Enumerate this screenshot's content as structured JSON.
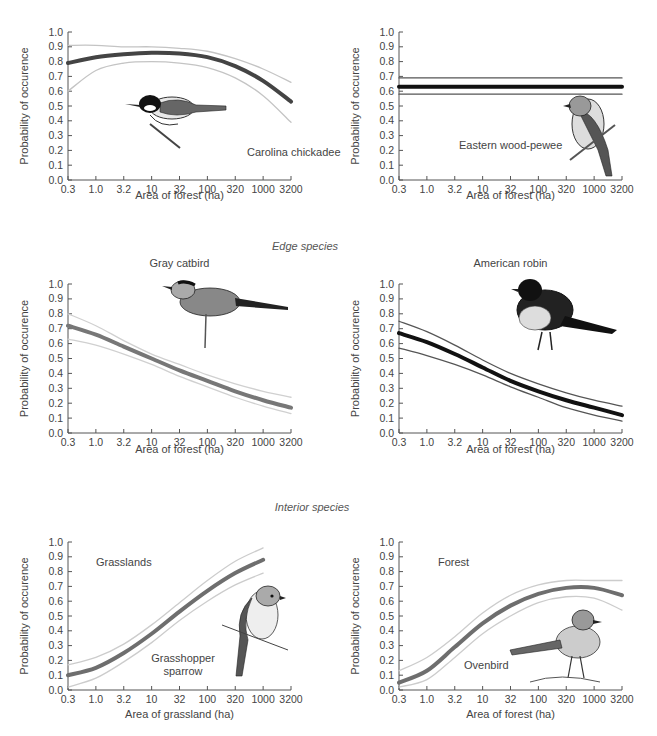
{
  "sections": {
    "edge": "Edge species",
    "interior": "Interior species"
  },
  "chart_data": [
    {
      "type": "line",
      "id": "carolina-chickadee",
      "title": "",
      "annotation": "Carolina chickadee",
      "xlabel": "Area of forest (ha)",
      "ylabel": "Probability of occurence",
      "ylim": [
        0,
        1.0
      ],
      "yticks": [
        "0.0",
        "0.1",
        "0.2",
        "0.3",
        "0.4",
        "0.5",
        "0.6",
        "0.7",
        "0.8",
        "0.9",
        "1.0"
      ],
      "categories": [
        "0.3",
        "1.0",
        "3.2",
        "10",
        "32",
        "100",
        "320",
        "1000",
        "3200"
      ],
      "x_scale": "log",
      "grid": false,
      "series": [
        {
          "name": "upper CI",
          "values": [
            0.91,
            0.91,
            0.9,
            0.9,
            0.89,
            0.87,
            0.82,
            0.75,
            0.66
          ]
        },
        {
          "name": "estimate",
          "values": [
            0.79,
            0.83,
            0.85,
            0.86,
            0.855,
            0.83,
            0.77,
            0.67,
            0.53
          ]
        },
        {
          "name": "lower CI",
          "values": [
            0.6,
            0.74,
            0.79,
            0.8,
            0.79,
            0.76,
            0.69,
            0.57,
            0.39
          ]
        }
      ],
      "colors": {
        "estimate": "#444444",
        "ci": "#c4c4c4"
      }
    },
    {
      "type": "line",
      "id": "eastern-wood-pewee",
      "title": "",
      "annotation": "Eastern wood-pewee",
      "xlabel": "Area of forest (ha)",
      "ylabel": "Probability of occurence",
      "ylim": [
        0,
        1.0
      ],
      "yticks": [
        "0.0",
        "0.1",
        "0.2",
        "0.3",
        "0.4",
        "0.5",
        "0.6",
        "0.7",
        "0.8",
        "0.9",
        "1.0"
      ],
      "categories": [
        "0.3",
        "1.0",
        "3.2",
        "10",
        "32",
        "100",
        "320",
        "1000",
        "3200"
      ],
      "x_scale": "log",
      "grid": false,
      "series": [
        {
          "name": "upper CI",
          "values": [
            0.69,
            0.69,
            0.69,
            0.69,
            0.69,
            0.69,
            0.69,
            0.69,
            0.69
          ]
        },
        {
          "name": "estimate",
          "values": [
            0.63,
            0.63,
            0.63,
            0.63,
            0.63,
            0.63,
            0.63,
            0.63,
            0.63
          ]
        },
        {
          "name": "lower CI",
          "values": [
            0.58,
            0.58,
            0.58,
            0.58,
            0.58,
            0.58,
            0.58,
            0.58,
            0.58
          ]
        }
      ],
      "colors": {
        "estimate": "#111111",
        "ci": "#555555"
      }
    },
    {
      "type": "line",
      "id": "gray-catbird",
      "title": "Gray catbird",
      "annotation": "",
      "xlabel": "Area of forest (ha)",
      "ylabel": "Probability of occurence",
      "ylim": [
        0,
        1.0
      ],
      "yticks": [
        "0.0",
        "0.1",
        "0.2",
        "0.3",
        "0.4",
        "0.5",
        "0.6",
        "0.7",
        "0.8",
        "0.9",
        "1.0"
      ],
      "categories": [
        "0.3",
        "1.0",
        "3.2",
        "10",
        "32",
        "100",
        "320",
        "1000",
        "3200"
      ],
      "x_scale": "log",
      "grid": false,
      "series": [
        {
          "name": "upper CI",
          "values": [
            0.8,
            0.72,
            0.62,
            0.53,
            0.46,
            0.39,
            0.33,
            0.28,
            0.24
          ]
        },
        {
          "name": "estimate",
          "values": [
            0.72,
            0.66,
            0.58,
            0.5,
            0.42,
            0.35,
            0.28,
            0.22,
            0.17
          ]
        },
        {
          "name": "lower CI",
          "values": [
            0.63,
            0.59,
            0.53,
            0.46,
            0.38,
            0.31,
            0.24,
            0.18,
            0.13
          ]
        }
      ],
      "colors": {
        "estimate": "#777777",
        "ci": "#d0d0d0"
      }
    },
    {
      "type": "line",
      "id": "american-robin",
      "title": "American robin",
      "annotation": "",
      "xlabel": "Area of forest (ha)",
      "ylabel": "Probability of occurence",
      "ylim": [
        0,
        1.0
      ],
      "yticks": [
        "0.0",
        "0.1",
        "0.2",
        "0.3",
        "0.4",
        "0.5",
        "0.6",
        "0.7",
        "0.8",
        "0.9",
        "1.0"
      ],
      "categories": [
        "0.3",
        "1.0",
        "3.2",
        "10",
        "32",
        "100",
        "320",
        "1000",
        "3200"
      ],
      "x_scale": "log",
      "grid": false,
      "series": [
        {
          "name": "upper CI",
          "values": [
            0.75,
            0.68,
            0.59,
            0.49,
            0.4,
            0.33,
            0.27,
            0.22,
            0.18
          ]
        },
        {
          "name": "estimate",
          "values": [
            0.67,
            0.61,
            0.53,
            0.44,
            0.35,
            0.28,
            0.22,
            0.17,
            0.12
          ]
        },
        {
          "name": "lower CI",
          "values": [
            0.57,
            0.52,
            0.46,
            0.39,
            0.31,
            0.24,
            0.17,
            0.12,
            0.08
          ]
        }
      ],
      "colors": {
        "estimate": "#111111",
        "ci": "#555555"
      }
    },
    {
      "type": "line",
      "id": "grasshopper-sparrow",
      "title": "",
      "annotation": "Grasshopper sparrow",
      "inset_label": "Grasslands",
      "xlabel": "Area of grassland (ha)",
      "ylabel": "Probability of occurence",
      "ylim": [
        0,
        1.0
      ],
      "yticks": [
        "0.0",
        "0.1",
        "0.2",
        "0.3",
        "0.4",
        "0.5",
        "0.6",
        "0.7",
        "0.8",
        "0.9",
        "1.0"
      ],
      "categories": [
        "0.3",
        "1.0",
        "3.2",
        "10",
        "32",
        "100",
        "320",
        "1000",
        "3200"
      ],
      "x_scale": "log",
      "grid": false,
      "series": [
        {
          "name": "upper CI",
          "values": [
            0.17,
            0.22,
            0.31,
            0.44,
            0.59,
            0.74,
            0.87,
            0.96,
            null
          ]
        },
        {
          "name": "estimate",
          "values": [
            0.1,
            0.15,
            0.25,
            0.38,
            0.53,
            0.67,
            0.79,
            0.88,
            null
          ]
        },
        {
          "name": "lower CI",
          "values": [
            0.02,
            0.08,
            0.19,
            0.32,
            0.47,
            0.6,
            0.71,
            0.79,
            null
          ]
        }
      ],
      "colors": {
        "estimate": "#6e6e6e",
        "ci": "#cccccc"
      }
    },
    {
      "type": "line",
      "id": "ovenbird",
      "title": "",
      "annotation": "Ovenbird",
      "inset_label": "Forest",
      "xlabel": "Area of forest (ha)",
      "ylabel": "Probability of occurence",
      "ylim": [
        0,
        1.0
      ],
      "yticks": [
        "0.0",
        "0.1",
        "0.2",
        "0.3",
        "0.4",
        "0.5",
        "0.6",
        "0.7",
        "0.8",
        "0.9",
        "1.0"
      ],
      "categories": [
        "0.3",
        "1.0",
        "3.2",
        "10",
        "32",
        "100",
        "320",
        "1000",
        "3200"
      ],
      "x_scale": "log",
      "grid": false,
      "series": [
        {
          "name": "upper CI",
          "values": [
            0.13,
            0.22,
            0.36,
            0.52,
            0.64,
            0.71,
            0.74,
            0.74,
            0.74
          ]
        },
        {
          "name": "estimate",
          "values": [
            0.05,
            0.13,
            0.29,
            0.45,
            0.57,
            0.65,
            0.69,
            0.69,
            0.64
          ]
        },
        {
          "name": "lower CI",
          "values": [
            0.02,
            0.07,
            0.22,
            0.38,
            0.5,
            0.59,
            0.63,
            0.62,
            0.54
          ]
        }
      ],
      "colors": {
        "estimate": "#6e6e6e",
        "ci": "#cccccc"
      }
    }
  ]
}
